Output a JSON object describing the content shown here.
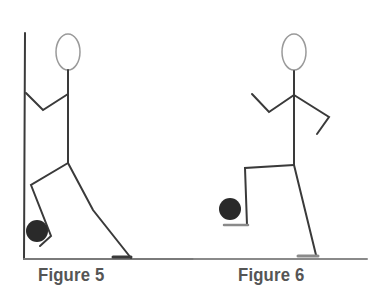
{
  "figures": [
    {
      "id": "figure-5",
      "caption": "Figure 5",
      "description": "Stick figure leaning back against a wall, one knee raised holding a ball against the wall with the foot"
    },
    {
      "id": "figure-6",
      "caption": "Figure 6",
      "description": "Stick figure standing, raising one leg with foot on top of a ball"
    }
  ],
  "colors": {
    "line": "#3a3a3a",
    "head": "#9a9a9a",
    "ball": "#2a2a2a",
    "ground": "#8a8a8a",
    "caption": "#555555"
  }
}
